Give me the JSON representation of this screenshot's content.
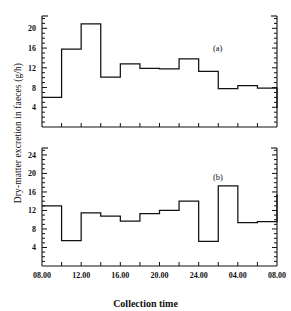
{
  "figure": {
    "ylabel": "Dry-matter excretion in faeces (g/h)",
    "xlabel": "Collection time",
    "panel_a_tag": "(a)",
    "panel_b_tag": "(b)",
    "line_color": "#111111"
  },
  "chart_data": [
    {
      "type": "line",
      "subtype": "step",
      "title": "(a)",
      "xlabel": "Collection time",
      "ylabel": "Dry-matter excretion in faeces (g/h)",
      "x_tick_labels": [
        "08.00",
        "12.00",
        "16.00",
        "20.00",
        "24.00",
        "04.00",
        "08.00"
      ],
      "x_tick_values": [
        8,
        12,
        16,
        20,
        24,
        28,
        32
      ],
      "xlim": [
        8,
        32
      ],
      "y_tick_labels": [
        "4",
        "8",
        "12",
        "16",
        "20"
      ],
      "y_tick_values": [
        4,
        8,
        12,
        16,
        20
      ],
      "ylim": [
        0,
        22.5
      ],
      "y_minor_tick_step": 1,
      "grid": false,
      "legend": false,
      "bin_edges": [
        8,
        10,
        12,
        14,
        16,
        18,
        20,
        22,
        24,
        26,
        28,
        30,
        32
      ],
      "bin_labels": [
        "08-10",
        "10-12",
        "12-14",
        "14-16",
        "16-18",
        "18-20",
        "20-22",
        "22-24",
        "24-02",
        "02-04",
        "04-06",
        "06-08"
      ],
      "values": [
        6.0,
        15.8,
        20.9,
        10.1,
        12.8,
        11.9,
        11.8,
        13.8,
        11.3,
        7.8,
        8.4,
        7.9,
        3.8
      ]
    },
    {
      "type": "line",
      "subtype": "step",
      "title": "(b)",
      "xlabel": "Collection time",
      "ylabel": "Dry-matter excretion in faeces (g/h)",
      "x_tick_labels": [
        "08.00",
        "12.00",
        "16.00",
        "20.00",
        "24.00",
        "04.00",
        "08.00"
      ],
      "x_tick_values": [
        8,
        12,
        16,
        20,
        24,
        28,
        32
      ],
      "xlim": [
        8,
        32
      ],
      "y_tick_labels": [
        "4",
        "8",
        "12",
        "16",
        "20",
        "24"
      ],
      "y_tick_values": [
        4,
        8,
        12,
        16,
        20,
        24
      ],
      "ylim": [
        0,
        25.5
      ],
      "y_minor_tick_step": 1,
      "grid": false,
      "legend": false,
      "bin_edges": [
        8,
        10,
        12,
        14,
        16,
        18,
        20,
        22,
        24,
        26,
        28,
        30,
        32
      ],
      "bin_labels": [
        "08-10",
        "10-12",
        "12-14",
        "14-16",
        "16-18",
        "18-20",
        "20-22",
        "22-24",
        "24-02",
        "02-04",
        "04-06",
        "06-08"
      ],
      "values": [
        13.0,
        5.5,
        11.5,
        10.8,
        9.7,
        11.3,
        12.0,
        14.0,
        5.3,
        17.3,
        9.4,
        9.6,
        15.5
      ]
    }
  ]
}
